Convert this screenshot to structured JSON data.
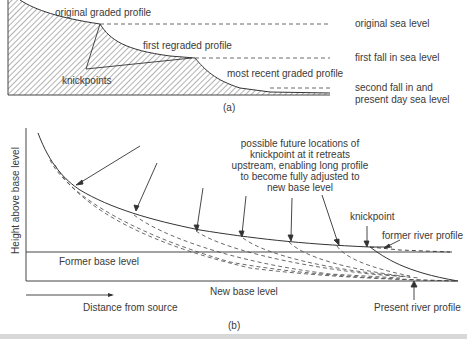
{
  "panel_a": {
    "caption": "(a)",
    "labels": {
      "original_graded_profile": "original graded profile",
      "first_regraded_profile": "first regraded profile",
      "knickpoints": "knickpoints",
      "most_recent_graded_profile": "most recent graded profile",
      "original_sea_level": "original sea level",
      "first_fall": "first fall in sea level",
      "second_fall_line1": "second fall in and",
      "second_fall_line2": "present day sea level"
    }
  },
  "panel_b": {
    "caption": "(b)",
    "y_axis_label": "Height above base level",
    "x_axis_label": "Distance from source",
    "annotation": [
      "possible future locations of",
      "knickpoint at it retreats",
      "upstream, enabling long profile",
      "to become fully adjusted to",
      "new base level"
    ],
    "labels": {
      "knickpoint": "knickpoint",
      "former_river_profile": "former river profile",
      "former_base_level": "Former base level",
      "new_base_level": "New base level",
      "present_river_profile": "Present river profile"
    }
  },
  "colors": {
    "line": "#333333",
    "hatch": "#555555",
    "text": "#3a3a3a",
    "bottom_bar": "#d8d8d8"
  }
}
